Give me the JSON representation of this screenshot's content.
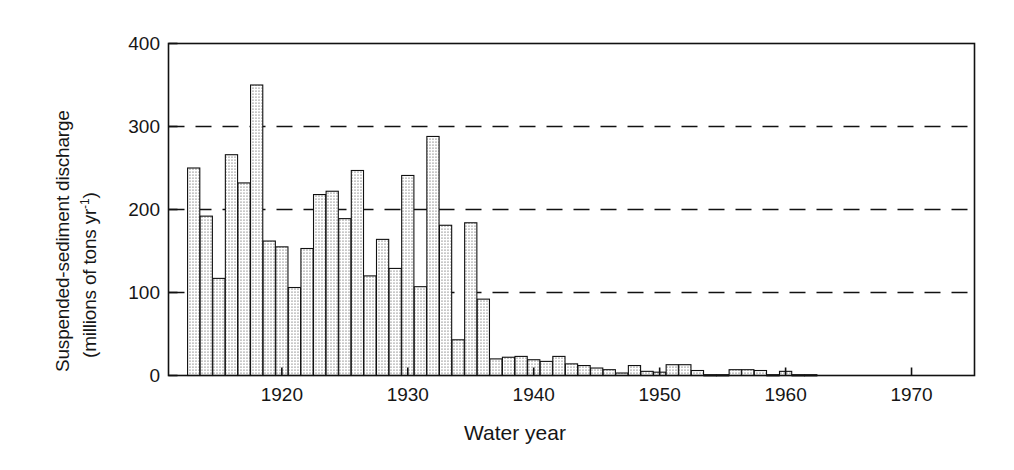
{
  "chart_data": {
    "type": "bar",
    "title": "",
    "xlabel": "Water year",
    "ylabel_line1": "Suspended-sediment discharge",
    "ylabel_line2_prefix": "(millions of tons yr",
    "ylabel_line2_sup": "-1",
    "ylabel_line2_suffix": ")",
    "ylabel_full": "Suspended-sediment discharge (millions of tons yr-1)",
    "xlim": [
      1911,
      1975
    ],
    "ylim": [
      0,
      400
    ],
    "yticks": [
      0,
      100,
      200,
      300,
      400
    ],
    "ytick_labels": [
      "0",
      "100",
      "200",
      "300",
      "400"
    ],
    "xticks": [
      1920,
      1930,
      1940,
      1950,
      1960,
      1970
    ],
    "xtick_labels": [
      "1920",
      "1930",
      "1940",
      "1950",
      "1960",
      "1970"
    ],
    "grid": "horizontal-dashed",
    "gridlines_at": [
      100,
      200,
      300
    ],
    "legend": "none",
    "bar_fill": "stippled-dots",
    "bar_edge_color": "#111111",
    "categories": [
      1913,
      1914,
      1915,
      1916,
      1917,
      1918,
      1919,
      1920,
      1921,
      1922,
      1923,
      1924,
      1925,
      1926,
      1927,
      1928,
      1929,
      1930,
      1931,
      1932,
      1933,
      1934,
      1935,
      1936,
      1937,
      1938,
      1939,
      1940,
      1941,
      1942,
      1943,
      1944,
      1945,
      1946,
      1947,
      1948,
      1949,
      1950,
      1951,
      1952,
      1953,
      1954,
      1955,
      1956,
      1957,
      1958,
      1959,
      1960,
      1961,
      1962
    ],
    "values": [
      250,
      192,
      117,
      266,
      232,
      350,
      162,
      155,
      106,
      153,
      218,
      222,
      189,
      247,
      120,
      164,
      129,
      241,
      107,
      288,
      181,
      43,
      184,
      92,
      20,
      22,
      23,
      19,
      17,
      23,
      14,
      12,
      9,
      7,
      3,
      12,
      5,
      4,
      13,
      13,
      6,
      1,
      1,
      7,
      7,
      6,
      1,
      5,
      1,
      1
    ]
  }
}
